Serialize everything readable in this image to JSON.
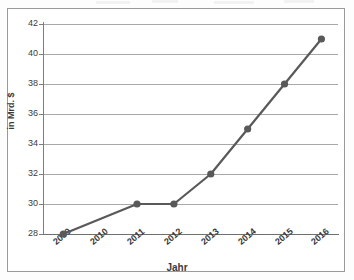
{
  "chart_data": {
    "type": "line",
    "title": "",
    "subtitle": "",
    "xlabel": "Jahr",
    "ylabel": "in Mrd. $",
    "categories": [
      "2009",
      "2010",
      "2011",
      "2012",
      "2013",
      "2014",
      "2015",
      "2016"
    ],
    "series": [
      {
        "name": "",
        "values": [
          28,
          29,
          30,
          30,
          32,
          35,
          38,
          41
        ]
      }
    ],
    "ylim": [
      28,
      42
    ],
    "yticks": [
      28,
      30,
      32,
      34,
      36,
      38,
      40,
      42
    ],
    "ytick_labels": [
      "28",
      "30",
      "32",
      "34",
      "36",
      "38",
      "40",
      "42"
    ],
    "xtick_labels": [
      "2009",
      "2010",
      "2011",
      "2012",
      "2013",
      "2014",
      "2015",
      "2016"
    ],
    "grid": true,
    "grid_axis": "y",
    "legend": false,
    "legend_position": "none",
    "markers": true,
    "marker_shape": "circle",
    "annotations": [],
    "colors": {
      "line": "#595959",
      "marker": "#595959",
      "gridline": "#a8a8a8",
      "axis": "#7d7d7d",
      "text": "#3b3b3b",
      "plot_background": "#ffffff",
      "frame_border": "#9a9a9a"
    }
  },
  "axes": {
    "y_title": "in Mrd. $",
    "x_title": "Jahr"
  }
}
